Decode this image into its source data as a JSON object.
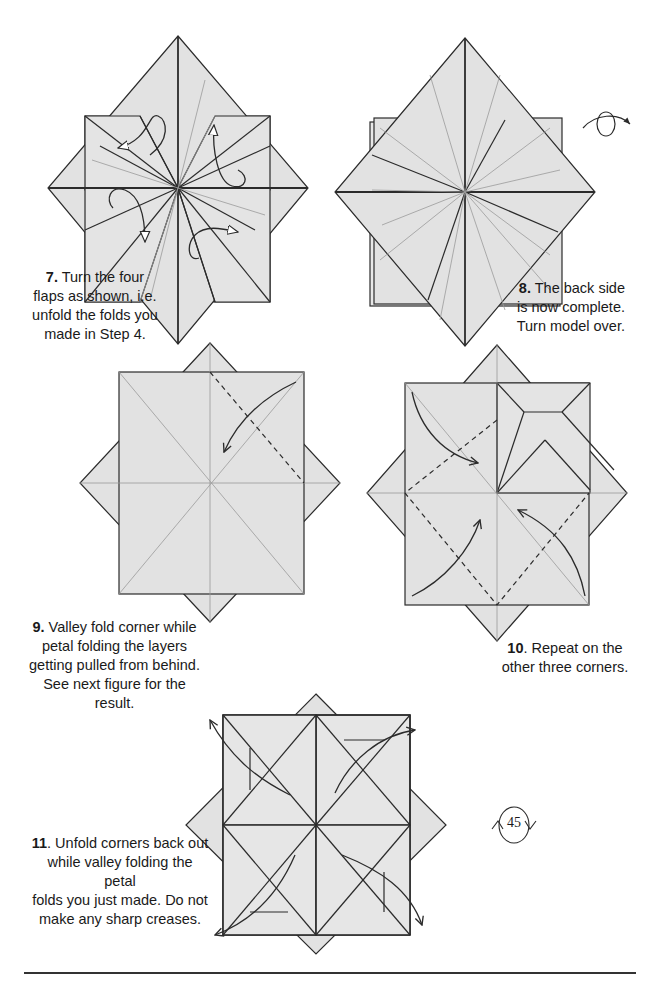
{
  "page": {
    "number": "45",
    "colors": {
      "paper": "#e2e2e2",
      "line": "#2b2b2b",
      "crease": "#9a9a9a",
      "text": "#1a1a1a",
      "background": "#ffffff"
    }
  },
  "steps": [
    {
      "number": "7.",
      "text": "Turn the four flaps as shown, i.e. unfold the folds you made in Step 4.",
      "lines": [
        "Turn the four",
        "flaps as shown, i.e.",
        "unfold the folds you",
        "made in Step 4."
      ]
    },
    {
      "number": "8.",
      "text": "The back side is now complete. Turn model over.",
      "lines": [
        "The back side",
        "is now complete.",
        "Turn model over."
      ]
    },
    {
      "number": "9.",
      "text": "Valley fold corner while petal folding the layers getting pulled from behind. See next figure for the result.",
      "lines": [
        "Valley fold corner while",
        "petal folding the layers",
        "getting pulled from behind.",
        "See next figure for the result."
      ]
    },
    {
      "number": "10",
      "text": ". Repeat on the other three corners.",
      "lines": [
        ". Repeat on the",
        "other three corners."
      ]
    },
    {
      "number": "11",
      "text": ". Unfold corners back out while valley folding the petal folds you just made.  Do not make any sharp creases.",
      "lines": [
        ". Unfold corners back out",
        "while valley folding the petal",
        "folds you just made.  Do not",
        "make any sharp creases."
      ]
    }
  ],
  "icons": {
    "turn_over": "turn-over-icon",
    "rotate": "rotate-icon"
  }
}
